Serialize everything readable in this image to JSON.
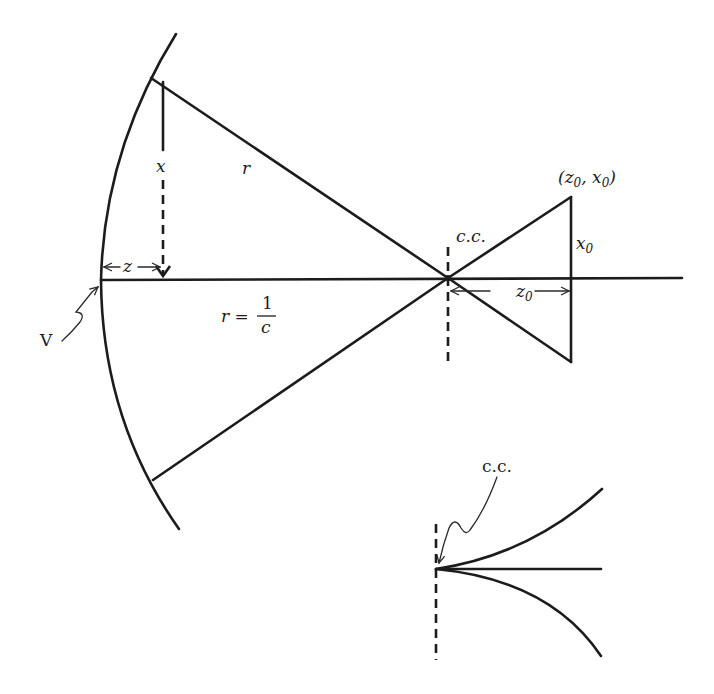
{
  "diagram": {
    "main": {
      "labels": {
        "x": "x",
        "r_upper": "r",
        "z": "z",
        "r_eq": "r =",
        "frac_num": "1",
        "frac_den": "c",
        "vertex": "V",
        "cc": "c.c.",
        "point": "(z",
        "point_sub0": "0",
        "point_mid": ", x",
        "point_sub1": "0",
        "point_end": ")",
        "x0": "x",
        "x0_sub": "0",
        "z0": "z",
        "z0_sub": "0"
      },
      "elements": [
        "surface-arc",
        "optical-axis",
        "radius-upper",
        "radius-lower",
        "x-sag-arrow",
        "z-arrow",
        "cc-dashed-line",
        "small-triangle",
        "z0-arrow",
        "vertex-pointer"
      ]
    },
    "inset": {
      "labels": {
        "cc": "c.c."
      },
      "elements": [
        "cc-dashed-line",
        "upper-curve",
        "axis-line",
        "lower-curve",
        "cc-pointer"
      ]
    }
  }
}
